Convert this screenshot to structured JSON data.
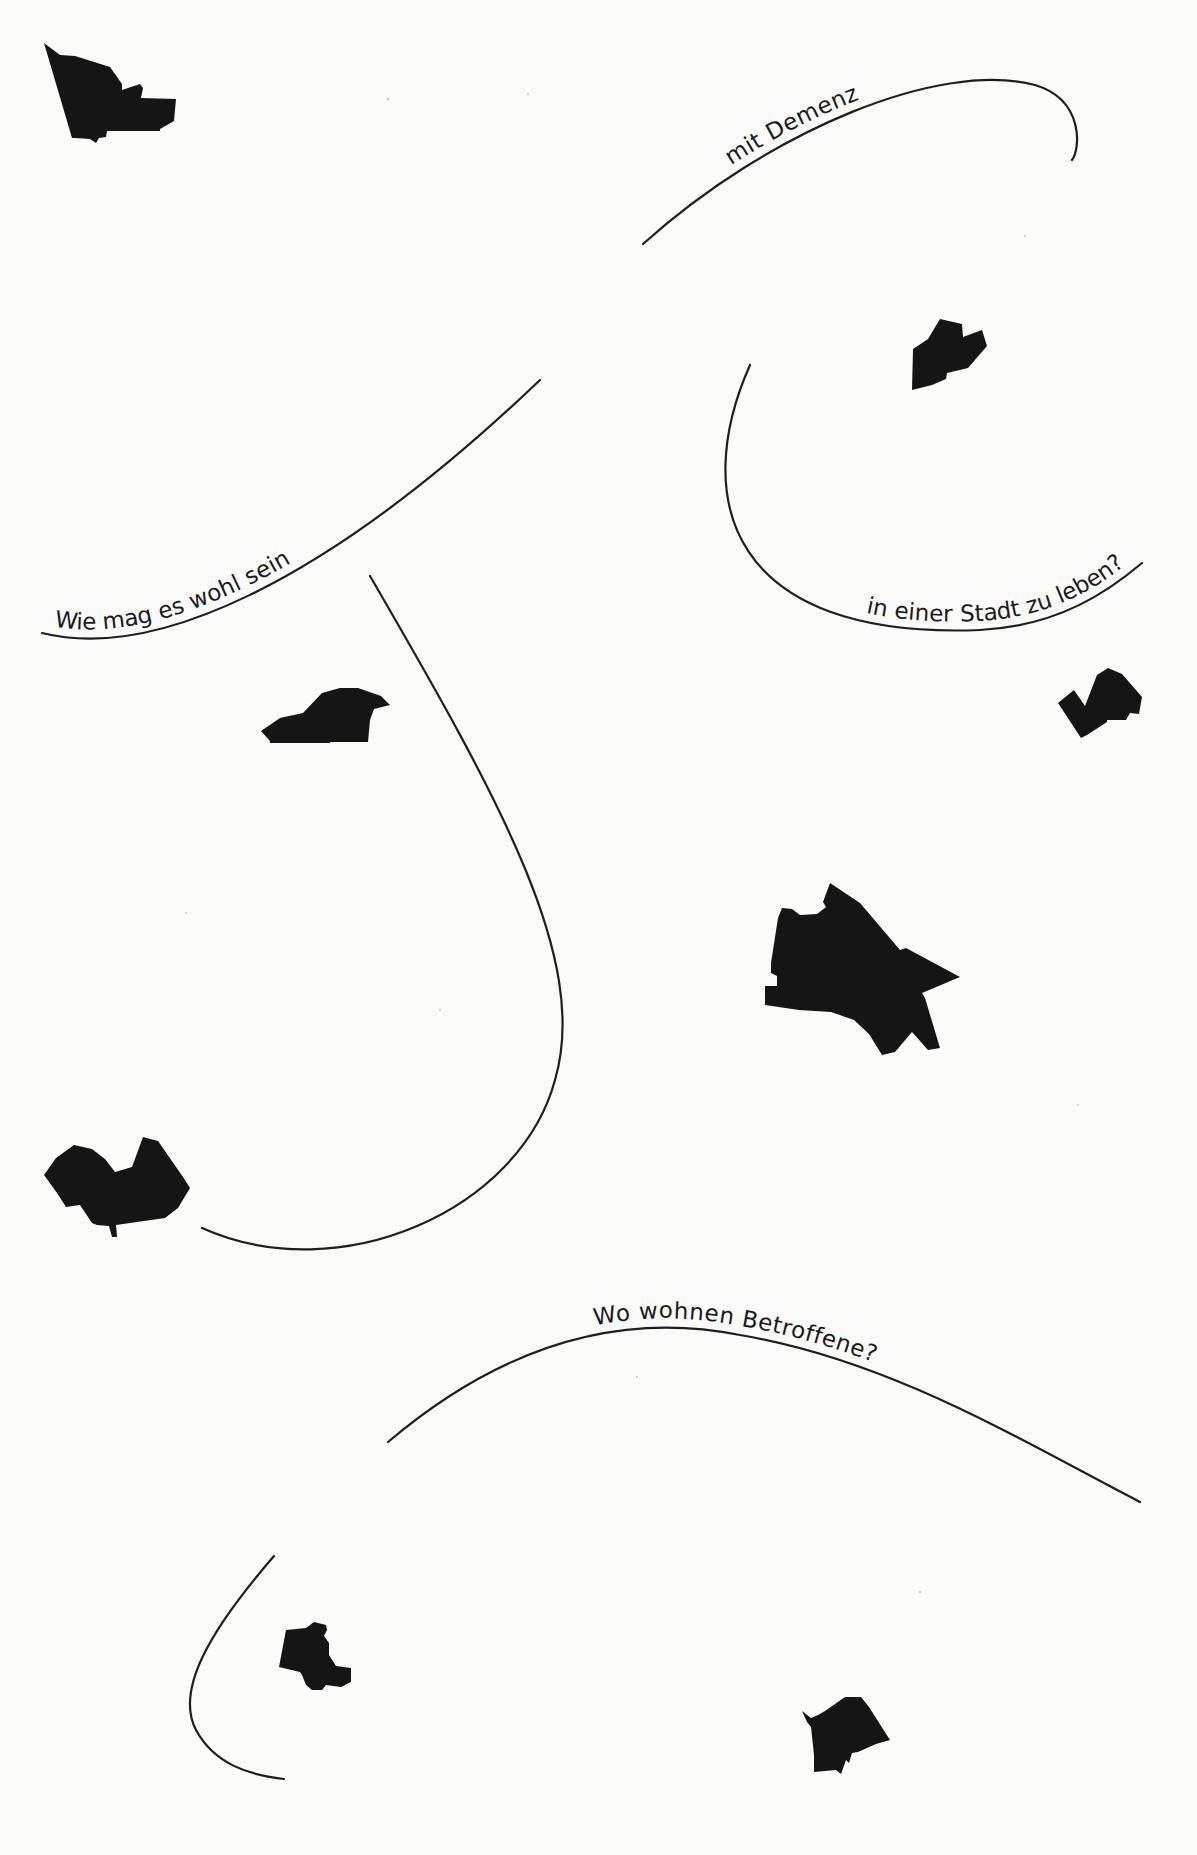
{
  "colors": {
    "background": "#fbfbfa",
    "ink": "#151515",
    "line": "#1e1e1e"
  },
  "captions": [
    {
      "id": "cap1",
      "text": "Wie mag es wohl sein",
      "path": "M42,633 C150,660 320,590 540,380",
      "offset": "2%"
    },
    {
      "id": "cap2",
      "text": "mit Demenz",
      "path": "M643,244 C770,130 940,60 1035,85 C1085,100 1080,150 1072,160",
      "offset": "22%"
    },
    {
      "id": "cap3",
      "text": "in einer Stadt zu leben?",
      "path": "M750,365 C690,500 730,640 980,630 C1060,626 1110,590 1142,563",
      "offset": "53%"
    },
    {
      "id": "cap4",
      "text": "Wo wohnen Betroffene?",
      "path": "M388,1442 C520,1330 640,1315 740,1335 C890,1360 1020,1440 1140,1502",
      "offset": "29%"
    }
  ],
  "curves": [
    {
      "id": "curve-loop-center",
      "path": "M370,576 C500,800 590,960 555,1080 C520,1210 340,1290 202,1228"
    },
    {
      "id": "curve-bottom-left",
      "path": "M274,1556 C210,1630 175,1690 196,1730 C215,1765 250,1775 284,1779"
    }
  ],
  "shapes": [
    {
      "id": "district-1",
      "points": "44,43 60,55 75,56 110,67 122,84 122,90 140,84 143,88 141,98 176,99 174,121 160,129 160,131 107,131 106,137 99,138 96,143 90,139 75,138 72,138"
    },
    {
      "id": "district-2",
      "points": "913,349 928,339 940,319 962,324 963,337 982,330 987,346 968,368 947,373 946,379 932,385 912,390"
    },
    {
      "id": "district-3",
      "points": "1058,703 1074,690 1085,706 1097,675 1108,668 1122,674 1142,697 1139,714 1130,713 1126,720 1107,720 1107,722 1087,735 1081,738"
    },
    {
      "id": "district-4",
      "points": "261,731 280,718 303,713 322,693 340,688 358,688 381,696 390,705 374,709 370,720 368,742 330,742 330,743 270,743 270,741"
    },
    {
      "id": "district-5",
      "points": "778,918 782,908 792,909 800,915 817,914 826,907 823,902 830,883 860,903 900,950 906,948 960,977 922,993 925,998 940,1048 928,1050 912,1032 895,1052 882,1055 869,1034 854,1020 831,1012 799,1010 765,1005 765,986 777,986 777,976 771,973 771,963"
    },
    {
      "id": "district-6",
      "points": "44,1175 56,1158 74,1145 92,1149 105,1159 115,1172 132,1167 143,1137 158,1141 183,1177 190,1188 178,1208 165,1218 116,1225 117,1237 112,1237 109,1226 97,1225 92,1223 80,1205 66,1207 57,1193"
    },
    {
      "id": "district-7",
      "points": "286,1630 306,1628 314,1622 326,1625 327,1630 324,1636 329,1643 329,1655 336,1666 351,1668 351,1682 341,1687 326,1685 322,1690 312,1690 306,1685 302,1675 300,1672 279,1667"
    },
    {
      "id": "district-8",
      "points": "802,1711 811,1718 818,1715 825,1711 845,1697 861,1697 869,1707 890,1740 876,1744 858,1752 852,1753 849,1763 846,1760 841,1774 836,1770 814,1772 814,1755 811,1727 807,1722"
    }
  ]
}
